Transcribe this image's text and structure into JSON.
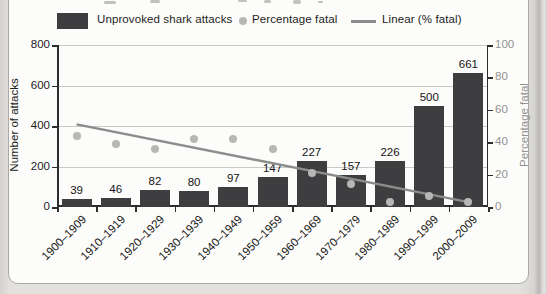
{
  "legend": [
    {
      "swatch": "bar",
      "label": "Unprovoked shark attacks"
    },
    {
      "swatch": "dot",
      "label": "Percentage fatal"
    },
    {
      "swatch": "line",
      "label": "Linear (% fatal)"
    }
  ],
  "chart_data": {
    "type": "bar",
    "categories": [
      "1900–1909",
      "1910–1919",
      "1920–1929",
      "1930–1939",
      "1940–1949",
      "1950–1959",
      "1960–1969",
      "1970–1979",
      "1980–1989",
      "1990–1999",
      "2000–2009"
    ],
    "series": [
      {
        "name": "Unprovoked shark attacks",
        "type": "bar",
        "axis": "left",
        "values": [
          39,
          46,
          82,
          80,
          97,
          147,
          227,
          157,
          226,
          500,
          661
        ]
      },
      {
        "name": "Percentage fatal",
        "type": "scatter",
        "axis": "right",
        "values": [
          44,
          39,
          36,
          42,
          42,
          36,
          21,
          14,
          3,
          7,
          3
        ]
      },
      {
        "name": "Linear (% fatal)",
        "type": "trendline",
        "axis": "right",
        "start_pct": 51,
        "end_pct": 3
      }
    ],
    "left_axis": {
      "title": "Number of attacks",
      "min": 0,
      "max": 800,
      "ticks": [
        0,
        200,
        400,
        600,
        800
      ]
    },
    "right_axis": {
      "title": "Percentage fatal",
      "min": 0,
      "max": 100,
      "ticks": [
        0,
        20,
        40,
        60,
        80,
        100
      ]
    },
    "grid": "horizontal",
    "legend_position": "top",
    "colors": {
      "bar": "#3e3e40",
      "dot": "#b7b7b5",
      "trend": "#8c8c8c",
      "grid": "#c9c9c7",
      "axis": "#2d2d2d",
      "right_axis_text": "#929290",
      "left_axis_text": "#1c1c1c"
    }
  }
}
